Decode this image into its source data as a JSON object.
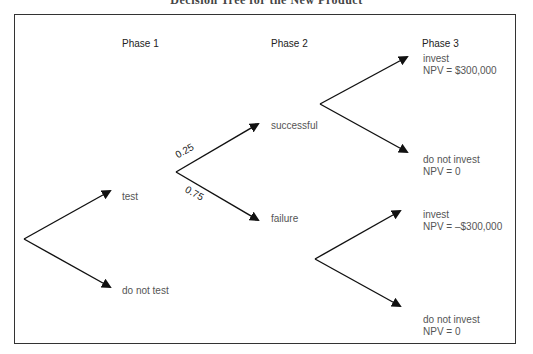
{
  "title": "Decision Tree for the New Product",
  "phases": [
    {
      "label": "Phase 1"
    },
    {
      "label": "Phase 2"
    },
    {
      "label": "Phase 3"
    }
  ],
  "phase1": {
    "test": "test",
    "do_not_test": "do not test"
  },
  "phase2": {
    "successful": "successful",
    "failure": "failure",
    "prob_success": "0.25",
    "prob_failure": "0.75"
  },
  "phase3": {
    "success_branch": {
      "invest": {
        "label": "invest",
        "npv": "NPV = $300,000"
      },
      "do_not_invest": {
        "label": "do not invest",
        "npv": "NPV = 0"
      }
    },
    "failure_branch": {
      "invest": {
        "label": "invest",
        "npv": "NPV = –$300,000"
      },
      "do_not_invest": {
        "label": "do not invest",
        "npv": "NPV = 0"
      }
    }
  },
  "colors": {
    "line": "#111111",
    "frame": "#333333",
    "label_text": "#555555"
  }
}
